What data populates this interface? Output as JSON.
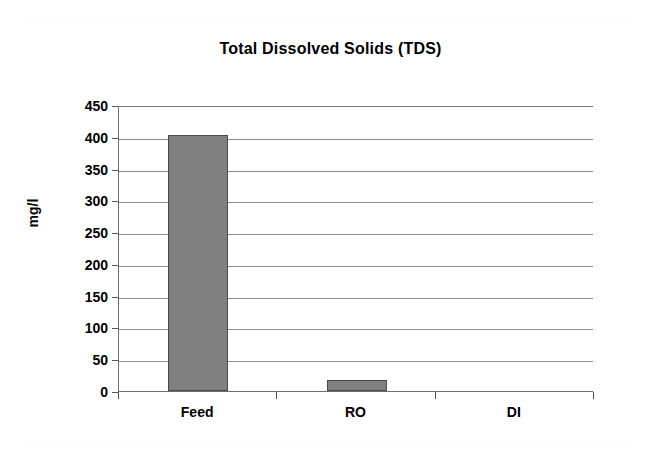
{
  "chart_data": {
    "type": "bar",
    "title": "Total Dissolved Solids (TDS)",
    "xlabel": "",
    "ylabel": "mg/l",
    "categories": [
      "Feed",
      "RO",
      "DI"
    ],
    "values": [
      403,
      18,
      0
    ],
    "ylim": [
      0,
      450
    ],
    "yticks": [
      0,
      50,
      100,
      150,
      200,
      250,
      300,
      350,
      400,
      450
    ],
    "ytick_labels": [
      "0",
      "50",
      "100",
      "150",
      "200",
      "250",
      "300",
      "350",
      "400",
      "450"
    ],
    "grid": true,
    "legend": null,
    "legend_position": "none",
    "series": [
      {
        "name": "TDS",
        "values": [
          403,
          18,
          0
        ],
        "color": "#808080"
      }
    ],
    "bar_color": "#808080",
    "bar_edge_color": "#4a4a4a"
  }
}
